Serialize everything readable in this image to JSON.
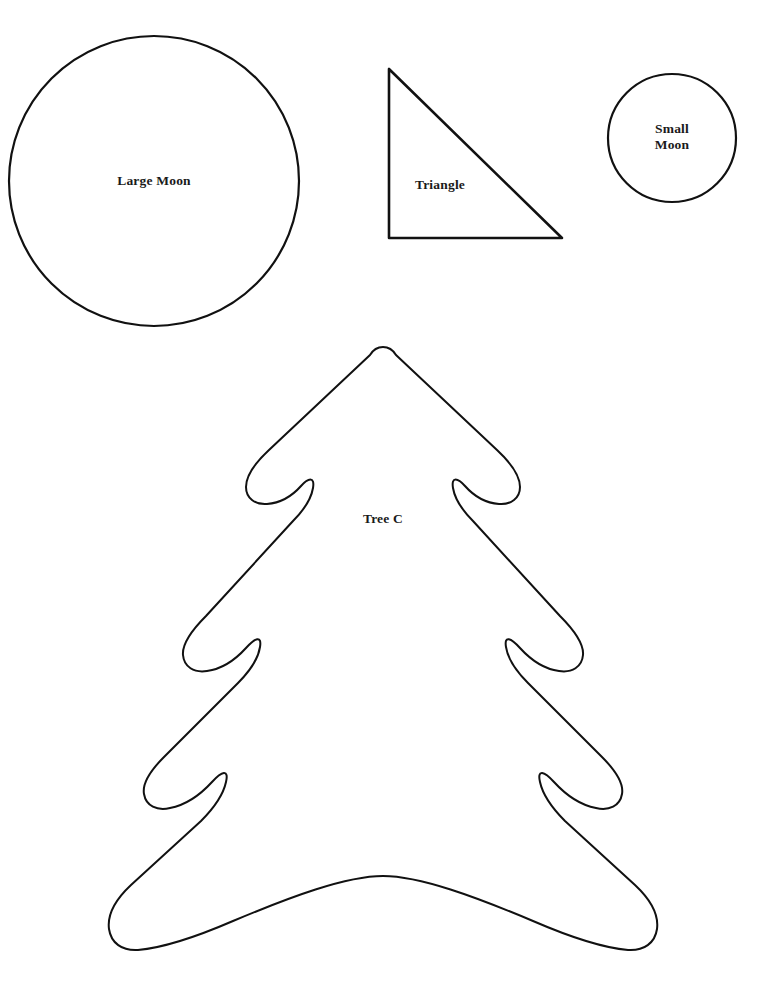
{
  "page": {
    "background_color": "#ffffff",
    "stroke_color": "#111111",
    "text_color": "#1a1a1a",
    "width": 778,
    "height": 989
  },
  "shapes": [
    {
      "id": "large-moon",
      "kind": "circle",
      "label": "Large Moon",
      "center_x": 154,
      "center_y": 181,
      "radius": 145,
      "stroke_width": 2.2
    },
    {
      "id": "triangle",
      "kind": "right-triangle",
      "label": "Triangle",
      "apex_x": 389,
      "apex_y": 69,
      "bottom_left_x": 389,
      "bottom_left_y": 238,
      "bottom_right_x": 562,
      "bottom_right_y": 238,
      "stroke_width": 2.6
    },
    {
      "id": "small-moon",
      "kind": "circle",
      "label": "Small Moon",
      "label_line_1": "Small",
      "label_line_2": "Moon",
      "center_x": 672,
      "center_y": 138,
      "radius": 64,
      "stroke_width": 2.2
    },
    {
      "id": "tree-c",
      "kind": "christmas-tree",
      "label": "Tree C",
      "apex_x": 383,
      "apex_y": 347,
      "left_extent": 108,
      "right_extent": 660,
      "bottom_y": 951,
      "stroke_width": 2.0,
      "tiers": 3
    }
  ],
  "labels": {
    "large_moon": "Large Moon",
    "triangle": "Triangle",
    "small_moon": "Small\nMoon",
    "tree_c": "Tree C"
  }
}
